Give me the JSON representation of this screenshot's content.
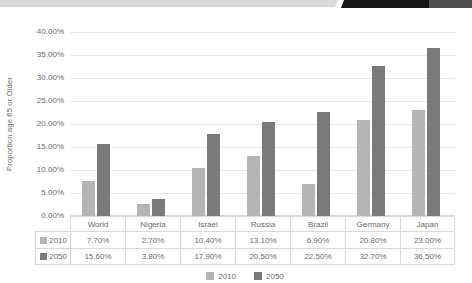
{
  "banner": {
    "segments": [
      {
        "name": "light",
        "color": "#dadada"
      },
      {
        "name": "black",
        "color": "#151515"
      },
      {
        "name": "dark",
        "color": "#4e4e4e"
      }
    ]
  },
  "colors": {
    "text": "#6b6b6b",
    "gridline": "#eaeaea",
    "table_border": "#d9d9d9",
    "background": "#ffffff",
    "series_2010": "#b5b5b5",
    "series_2050": "#7a7a7a"
  },
  "chart_data": {
    "type": "bar",
    "title": "",
    "ylabel": "Proportion age 65 or Older",
    "xlabel": "",
    "ylim": [
      0,
      40
    ],
    "ytick_step": 5,
    "ytick_labels": [
      "0.00%",
      "5.00%",
      "10.00%",
      "15.00%",
      "20.00%",
      "25.00%",
      "30.00%",
      "35.00%",
      "40.00%"
    ],
    "categories": [
      "World",
      "Nigeria",
      "Israel",
      "Russia",
      "Brazil",
      "Germany",
      "Japan"
    ],
    "series": [
      {
        "name": "2010",
        "color": "#b5b5b5",
        "values": [
          7.7,
          2.7,
          10.4,
          13.1,
          6.9,
          20.8,
          23.0
        ],
        "display": [
          "7.70%",
          "2.70%",
          "10.40%",
          "13.10%",
          "6.90%",
          "20.80%",
          "23.00%"
        ]
      },
      {
        "name": "2050",
        "color": "#7a7a7a",
        "values": [
          15.6,
          3.8,
          17.9,
          20.5,
          22.5,
          32.7,
          36.5
        ],
        "display": [
          "15.60%",
          "3.80%",
          "17.90%",
          "20.50%",
          "22.50%",
          "32.70%",
          "36.50%"
        ]
      }
    ],
    "legend": [
      "2010",
      "2050"
    ],
    "legend_position": "bottom",
    "grid": true,
    "data_table_shown": true
  }
}
